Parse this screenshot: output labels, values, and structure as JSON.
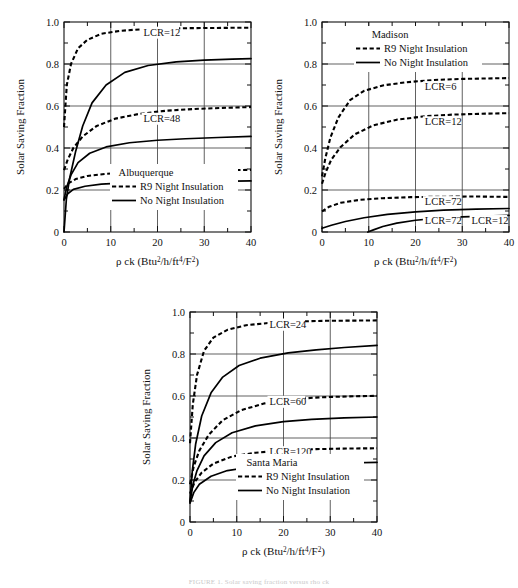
{
  "figure": {
    "caption": "FIGURE 1. Solar saving fraction versus rho ck",
    "axis_x_title": "ρ ck (Btu",
    "axis_x_title_parts": {
      "lead": "ρ ck (Btu",
      "sup1": "2",
      "mid1": "/h/ft",
      "sup2": "4",
      "mid2": "/F",
      "sup3": "2",
      "tail": ")"
    },
    "axis_y_title": "Solar Saving Fraction"
  },
  "chart_data": [
    {
      "type": "line",
      "title": "Albuquerque",
      "xlabel": "ρ ck (Btu2/h/ft4/F2)",
      "ylabel": "Solar Saving Fraction",
      "xlim": [
        0,
        40
      ],
      "ylim": [
        0,
        1.0
      ],
      "xticks": [
        0,
        10,
        20,
        30,
        40
      ],
      "yticks": [
        0,
        0.2,
        0.4,
        0.6,
        0.8,
        1.0
      ],
      "xtick_labels": [
        "0",
        "10",
        "20",
        "30",
        "40"
      ],
      "ytick_labels": [
        "0",
        "0.2",
        "0.4",
        "0.6",
        "0.8",
        "1.0"
      ],
      "grid": true,
      "legend_position": "lower-center",
      "legend": [
        {
          "label": "R9 Night Insulation",
          "style": "dashed"
        },
        {
          "label": "No Night Insulation",
          "style": "solid"
        }
      ],
      "annotations": [
        {
          "text": "LCR=12",
          "x": 17,
          "y": 0.935
        },
        {
          "text": "LCR=48",
          "x": 17,
          "y": 0.525
        },
        {
          "text": "LCR=120",
          "x": 17,
          "y": 0.258
        }
      ],
      "series": [
        {
          "name": "LCR=12 R9 Night Insulation",
          "style": "dashed",
          "x": [
            0,
            0.6,
            1.5,
            3,
            5,
            8,
            12,
            17,
            22,
            28,
            34,
            40
          ],
          "y": [
            0.5,
            0.7,
            0.8,
            0.875,
            0.915,
            0.944,
            0.958,
            0.966,
            0.969,
            0.971,
            0.972,
            0.973
          ]
        },
        {
          "name": "LCR=12 No Night Insulation",
          "style": "solid",
          "x": [
            0,
            0.5,
            1.2,
            2.5,
            4,
            6,
            9,
            13,
            18,
            24,
            30,
            36,
            40
          ],
          "y": [
            0.0,
            0.155,
            0.255,
            0.385,
            0.505,
            0.615,
            0.7,
            0.76,
            0.793,
            0.81,
            0.818,
            0.823,
            0.826
          ]
        },
        {
          "name": "LCR=48 R9 Night Insulation",
          "style": "dashed",
          "x": [
            0,
            0.8,
            2,
            4,
            7,
            11,
            16,
            22,
            28,
            34,
            40
          ],
          "y": [
            0.295,
            0.345,
            0.4,
            0.455,
            0.505,
            0.54,
            0.562,
            0.578,
            0.586,
            0.591,
            0.595
          ]
        },
        {
          "name": "LCR=48 No Night Insulation",
          "style": "solid",
          "x": [
            0,
            0.6,
            1.5,
            3,
            5.5,
            9,
            14,
            20,
            26,
            33,
            40
          ],
          "y": [
            0.155,
            0.215,
            0.272,
            0.33,
            0.375,
            0.405,
            0.425,
            0.437,
            0.444,
            0.45,
            0.455
          ]
        },
        {
          "name": "LCR=120 R9 Night Insulation",
          "style": "dashed",
          "x": [
            0,
            1,
            2.5,
            5,
            9,
            14,
            20,
            27,
            34,
            40
          ],
          "y": [
            0.205,
            0.233,
            0.252,
            0.267,
            0.277,
            0.283,
            0.287,
            0.291,
            0.294,
            0.296
          ]
        },
        {
          "name": "LCR=120 No Night Insulation",
          "style": "solid",
          "x": [
            0,
            0.8,
            2,
            4.5,
            8,
            13,
            19,
            26,
            33,
            40
          ],
          "y": [
            0.152,
            0.182,
            0.203,
            0.218,
            0.228,
            0.234,
            0.237,
            0.239,
            0.241,
            0.243
          ]
        }
      ]
    },
    {
      "type": "line",
      "title": "Madison",
      "xlabel": "ρ ck (Btu2/h/ft4/F2)",
      "ylabel": "Solar Saving Fraction",
      "xlim": [
        0,
        40
      ],
      "ylim": [
        0,
        1.0
      ],
      "xticks": [
        0,
        10,
        20,
        30,
        40
      ],
      "yticks": [
        0,
        0.2,
        0.4,
        0.6,
        0.8,
        1.0
      ],
      "xtick_labels": [
        "0",
        "10",
        "20",
        "30",
        "40"
      ],
      "ytick_labels": [
        "0",
        "0.2",
        "0.4",
        "0.6",
        "0.8",
        "1.0"
      ],
      "grid": true,
      "legend_position": "upper-center",
      "legend": [
        {
          "label": "R9 Night Insulation",
          "style": "dashed"
        },
        {
          "label": "No Night Insulation",
          "style": "solid"
        }
      ],
      "annotations": [
        {
          "text": "LCR=6",
          "x": 22,
          "y": 0.675
        },
        {
          "text": "LCR=12",
          "x": 22,
          "y": 0.508
        },
        {
          "text": "LCR=72",
          "x": 22,
          "y": 0.128
        },
        {
          "text": "LCR=72",
          "x": 22,
          "y": 0.038
        },
        {
          "text": "LCR=12",
          "x": 32,
          "y": 0.038
        }
      ],
      "series": [
        {
          "name": "LCR=6 R9 Night Insulation",
          "style": "dashed",
          "x": [
            0,
            0.7,
            1.8,
            3.5,
            6,
            9,
            13,
            18,
            24,
            30,
            35,
            40
          ],
          "y": [
            0.265,
            0.35,
            0.45,
            0.545,
            0.628,
            0.672,
            0.698,
            0.713,
            0.724,
            0.729,
            0.731,
            0.733
          ]
        },
        {
          "name": "LCR=12 R9 Night Insulation",
          "style": "dashed",
          "x": [
            0,
            0.8,
            2,
            4,
            7,
            11,
            16,
            22,
            28,
            34,
            40
          ],
          "y": [
            0.23,
            0.285,
            0.345,
            0.405,
            0.465,
            0.508,
            0.535,
            0.551,
            0.559,
            0.563,
            0.566
          ]
        },
        {
          "name": "LCR=72 R9 Night Insulation",
          "style": "dashed",
          "x": [
            0,
            1.5,
            4,
            8,
            13,
            19,
            26,
            33,
            40
          ],
          "y": [
            0.098,
            0.12,
            0.139,
            0.153,
            0.161,
            0.166,
            0.168,
            0.169,
            0.167
          ]
        },
        {
          "name": "LCR=72 No Night Insulation",
          "style": "solid",
          "x": [
            0,
            2,
            5,
            9,
            14,
            20,
            26,
            33,
            40
          ],
          "y": [
            0.018,
            0.032,
            0.05,
            0.068,
            0.084,
            0.096,
            0.104,
            0.109,
            0.112
          ]
        },
        {
          "name": "LCR=12 No Night Insulation",
          "style": "solid",
          "x": [
            9.8,
            11,
            13,
            16,
            20,
            25,
            30,
            35,
            40
          ],
          "y": [
            0.0,
            0.01,
            0.026,
            0.042,
            0.056,
            0.066,
            0.072,
            0.076,
            0.079
          ]
        }
      ]
    },
    {
      "type": "line",
      "title": "Santa Maria",
      "xlabel": "ρ ck (Btu2/h/ft4/F2)",
      "ylabel": "Solar Saving Fraction",
      "xlim": [
        0,
        40
      ],
      "ylim": [
        0,
        1.0
      ],
      "xticks": [
        0,
        10,
        20,
        30,
        40
      ],
      "yticks": [
        0,
        0.2,
        0.4,
        0.6,
        0.8,
        1.0
      ],
      "xtick_labels": [
        "0",
        "10",
        "20",
        "30",
        "40"
      ],
      "ytick_labels": [
        "0",
        "0.2",
        "0.4",
        "0.6",
        "0.8",
        "1.0"
      ],
      "grid": true,
      "legend_position": "lower-center",
      "legend": [
        {
          "label": "R9 Night Insulation",
          "style": "dashed"
        },
        {
          "label": "No Night Insulation",
          "style": "solid"
        }
      ],
      "annotations": [
        {
          "text": "LCR=24",
          "x": 17,
          "y": 0.925
        },
        {
          "text": "LCR=60",
          "x": 17,
          "y": 0.558
        },
        {
          "text": "LCR=120",
          "x": 17,
          "y": 0.318
        }
      ],
      "series": [
        {
          "name": "LCR=24 R9 Night Insulation",
          "style": "dashed",
          "x": [
            0,
            0.6,
            1.5,
            3,
            5,
            8,
            12,
            17,
            23,
            29,
            35,
            40
          ],
          "y": [
            0.375,
            0.56,
            0.7,
            0.815,
            0.878,
            0.915,
            0.937,
            0.948,
            0.955,
            0.958,
            0.959,
            0.96
          ]
        },
        {
          "name": "LCR=24 No Night Insulation",
          "style": "solid",
          "x": [
            0,
            0.5,
            1.2,
            2.5,
            4.5,
            7,
            10.5,
            15,
            21,
            27,
            33,
            40
          ],
          "y": [
            0.098,
            0.245,
            0.37,
            0.505,
            0.615,
            0.69,
            0.745,
            0.78,
            0.805,
            0.82,
            0.831,
            0.841
          ]
        },
        {
          "name": "LCR=60 R9 Night Insulation",
          "style": "dashed",
          "x": [
            0,
            0.8,
            2,
            4,
            7,
            11,
            16,
            22,
            28,
            34,
            40
          ],
          "y": [
            0.18,
            0.265,
            0.34,
            0.415,
            0.485,
            0.533,
            0.565,
            0.585,
            0.594,
            0.598,
            0.601
          ]
        },
        {
          "name": "LCR=60 No Night Insulation",
          "style": "solid",
          "x": [
            0,
            0.6,
            1.5,
            3,
            5.5,
            9,
            14,
            20,
            26,
            33,
            40
          ],
          "y": [
            0.095,
            0.175,
            0.245,
            0.315,
            0.378,
            0.425,
            0.458,
            0.478,
            0.489,
            0.496,
            0.5
          ]
        },
        {
          "name": "LCR=120 R9 Night Insulation",
          "style": "dashed",
          "x": [
            0,
            1,
            2.5,
            5,
            9,
            14,
            20,
            27,
            34,
            40
          ],
          "y": [
            0.135,
            0.19,
            0.235,
            0.278,
            0.312,
            0.33,
            0.341,
            0.347,
            0.35,
            0.351
          ]
        },
        {
          "name": "LCR=120 No Night Insulation",
          "style": "solid",
          "x": [
            0,
            0.8,
            2,
            4.5,
            8,
            13,
            19,
            26,
            33,
            40
          ],
          "y": [
            0.09,
            0.14,
            0.18,
            0.218,
            0.245,
            0.262,
            0.272,
            0.278,
            0.281,
            0.284
          ]
        }
      ]
    }
  ]
}
